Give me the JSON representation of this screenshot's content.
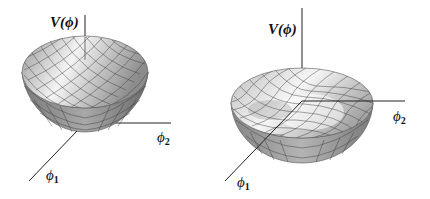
{
  "figure": {
    "panels": [
      {
        "id": "left",
        "shape": "paraboloid bowl (single minimum at origin)",
        "labels": {
          "vertical_axis": "V(ϕ)",
          "axis_x": "ϕ",
          "axis_x_sub": "2",
          "axis_y": "ϕ",
          "axis_y_sub": "1"
        }
      },
      {
        "id": "right",
        "shape": "Mexican hat (local maximum at origin, ring of minima)",
        "labels": {
          "vertical_axis": "V(ϕ)",
          "axis_x": "ϕ",
          "axis_x_sub": "2",
          "axis_y": "ϕ",
          "axis_y_sub": "1"
        }
      }
    ],
    "colors": {
      "surface_light": "#f2f2f2",
      "surface_dark": "#6e6e6e",
      "mesh": "#3a3a3a",
      "axis": "#222222"
    }
  }
}
